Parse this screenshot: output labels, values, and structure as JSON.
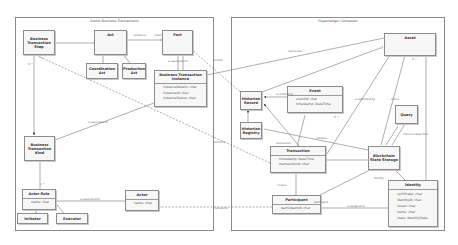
{
  "frames": {
    "left": {
      "title": "Demo Business Transactions"
    },
    "right": {
      "title": "Hyperledger Composer"
    }
  },
  "classes": {
    "bt_step": {
      "name": "Business Transaction Step"
    },
    "act": {
      "name": "Act"
    },
    "fact": {
      "name": "Fact"
    },
    "coordination_act": {
      "name": "Coordination Act"
    },
    "production_act": {
      "name": "Production Act"
    },
    "bt_instance": {
      "name": "Business Transaction Instance",
      "attributes": [
        "instanceDetails: char",
        "instanceId: char",
        "instanceStatus: char"
      ]
    },
    "bt_kind": {
      "name": "Business Transaction Kind"
    },
    "actor_role": {
      "name": "Actor Role",
      "attributes": [
        "name: char"
      ]
    },
    "actor": {
      "name": "Actor",
      "attributes": [
        "name: char"
      ]
    },
    "initiator": {
      "name": "Initiator"
    },
    "executor": {
      "name": "Executor"
    },
    "asset": {
      "name": "Asset"
    },
    "historian_record": {
      "name": "Historian Record"
    },
    "historian_registry": {
      "name": "Historian Registry"
    },
    "event": {
      "name": "Event",
      "attributes": [
        "eventId: char",
        "timestamp: DateTime"
      ]
    },
    "query": {
      "name": "Query"
    },
    "transaction": {
      "name": "Transaction",
      "attributes": [
        "timestamp: DateTime",
        "transactionId: char"
      ]
    },
    "blockchain_state_storage": {
      "name": "Blockchain State Storage"
    },
    "participant": {
      "name": "Participant",
      "attributes": [
        "participantId: char"
      ]
    },
    "identity": {
      "name": "Identity",
      "attributes": [
        "certificate: char",
        "identityId: char",
        "issuer: char",
        "name: char",
        "state: IdentityState"
      ]
    }
  },
  "labels": {
    "produces": "produces",
    "ofact": "ofact",
    "m_0n": "0..*",
    "m_1": "1",
    "m_1n": "1..*",
    "m_0_1": "0..1",
    "is_associated_to": "is associated to",
    "is_assigned_to": "is assigned to",
    "represents": "represents",
    "performs": "performs",
    "records": "records",
    "contains": "contains",
    "stores": "stores",
    "emitted": "is emitted by",
    "submitted": "is submitted by",
    "creates": "creates",
    "retrieves": "retrieves data from",
    "owner": "owner",
    "instance": "instance",
    "kind": "kind",
    "role": "role",
    "actor": "actor",
    "step": "step",
    "initiator": "initiator",
    "executor": "executor",
    "fact_label": "fact",
    "transaction": "transaction",
    "participant": "participant",
    "identity": "identity"
  }
}
